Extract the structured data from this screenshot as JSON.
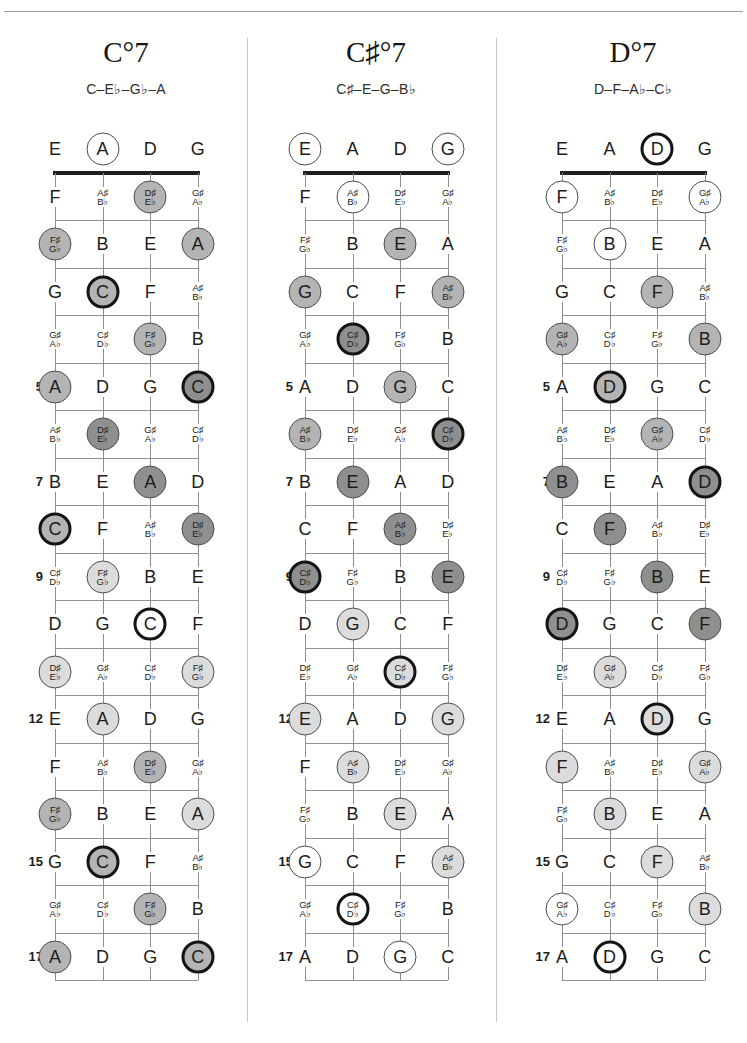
{
  "running_head": "SEVENTH CHORDS",
  "marker_styles": {
    "fills": {
      "w": "#ffffff",
      "l": "#dcdcdc",
      "m": "#b4b4b4",
      "d": "#8f8f8f"
    },
    "ring_thin": "#4d4d4d",
    "ring_root": "#141414"
  },
  "columns": [
    {
      "title": "C°7",
      "subtitle": "C–E♭–G♭–A",
      "rows": [
        {
          "fret": "",
          "cells": [
            [
              "E",
              null
            ],
            [
              "A",
              "w"
            ],
            [
              "D",
              null
            ],
            [
              "G",
              null
            ]
          ]
        },
        {
          "fret": "",
          "cells": [
            [
              "F",
              null
            ],
            [
              "A♯|B♭",
              null
            ],
            [
              "D♯|E♭",
              "m"
            ],
            [
              "G♯|A♭",
              null
            ]
          ]
        },
        {
          "fret": "",
          "cells": [
            [
              "F♯|G♭",
              "m"
            ],
            [
              "B",
              null
            ],
            [
              "E",
              null
            ],
            [
              "A",
              "m"
            ]
          ]
        },
        {
          "fret": "",
          "cells": [
            [
              "G",
              null
            ],
            [
              "C",
              "mR"
            ],
            [
              "F",
              null
            ],
            [
              "A♯|B♭",
              null
            ]
          ]
        },
        {
          "fret": "",
          "cells": [
            [
              "G♯|A♭",
              null
            ],
            [
              "C♯|D♭",
              null
            ],
            [
              "F♯|G♭",
              "m"
            ],
            [
              "B",
              null
            ]
          ]
        },
        {
          "fret": "5",
          "cells": [
            [
              "A",
              "m"
            ],
            [
              "D",
              null
            ],
            [
              "G",
              null
            ],
            [
              "C",
              "dR"
            ]
          ]
        },
        {
          "fret": "",
          "cells": [
            [
              "A♯|B♭",
              null
            ],
            [
              "D♯|E♭",
              "d"
            ],
            [
              "G♯|A♭",
              null
            ],
            [
              "C♯|D♭",
              null
            ]
          ]
        },
        {
          "fret": "7",
          "cells": [
            [
              "B",
              null
            ],
            [
              "E",
              null
            ],
            [
              "A",
              "d"
            ],
            [
              "D",
              null
            ]
          ]
        },
        {
          "fret": "",
          "cells": [
            [
              "C",
              "mR"
            ],
            [
              "F",
              null
            ],
            [
              "A♯|B♭",
              null
            ],
            [
              "D♯|E♭",
              "d"
            ]
          ]
        },
        {
          "fret": "9",
          "cells": [
            [
              "C♯|D♭",
              null
            ],
            [
              "F♯|G♭",
              "l"
            ],
            [
              "B",
              null
            ],
            [
              "E",
              null
            ]
          ]
        },
        {
          "fret": "",
          "cells": [
            [
              "D",
              null
            ],
            [
              "G",
              null
            ],
            [
              "C",
              "wR"
            ],
            [
              "F",
              null
            ]
          ]
        },
        {
          "fret": "",
          "cells": [
            [
              "D♯|E♭",
              "l"
            ],
            [
              "G♯|A♭",
              null
            ],
            [
              "C♯|D♭",
              null
            ],
            [
              "F♯|G♭",
              "l"
            ]
          ]
        },
        {
          "fret": "12",
          "cells": [
            [
              "E",
              null
            ],
            [
              "A",
              "l"
            ],
            [
              "D",
              null
            ],
            [
              "G",
              null
            ]
          ]
        },
        {
          "fret": "",
          "cells": [
            [
              "F",
              null
            ],
            [
              "A♯|B♭",
              null
            ],
            [
              "D♯|E♭",
              "m"
            ],
            [
              "G♯|A♭",
              null
            ]
          ]
        },
        {
          "fret": "",
          "cells": [
            [
              "F♯|G♭",
              "m"
            ],
            [
              "B",
              null
            ],
            [
              "E",
              null
            ],
            [
              "A",
              "l"
            ]
          ]
        },
        {
          "fret": "15",
          "cells": [
            [
              "G",
              null
            ],
            [
              "C",
              "mR"
            ],
            [
              "F",
              null
            ],
            [
              "A♯|B♭",
              null
            ]
          ]
        },
        {
          "fret": "",
          "cells": [
            [
              "G♯|A♭",
              null
            ],
            [
              "C♯|D♭",
              null
            ],
            [
              "F♯|G♭",
              "m"
            ],
            [
              "B",
              null
            ]
          ]
        },
        {
          "fret": "17",
          "cells": [
            [
              "A",
              "m"
            ],
            [
              "D",
              null
            ],
            [
              "G",
              null
            ],
            [
              "C",
              "mR"
            ]
          ]
        }
      ]
    },
    {
      "title": "C♯°7",
      "subtitle": "C♯–E–G–B♭",
      "rows": [
        {
          "fret": "",
          "cells": [
            [
              "E",
              "w"
            ],
            [
              "A",
              null
            ],
            [
              "D",
              null
            ],
            [
              "G",
              "w"
            ]
          ]
        },
        {
          "fret": "",
          "cells": [
            [
              "F",
              null
            ],
            [
              "A♯|B♭",
              "w"
            ],
            [
              "D♯|E♭",
              null
            ],
            [
              "G♯|A♭",
              null
            ]
          ]
        },
        {
          "fret": "",
          "cells": [
            [
              "F♯|G♭",
              null
            ],
            [
              "B",
              null
            ],
            [
              "E",
              "m"
            ],
            [
              "A",
              null
            ]
          ]
        },
        {
          "fret": "",
          "cells": [
            [
              "G",
              "m"
            ],
            [
              "C",
              null
            ],
            [
              "F",
              null
            ],
            [
              "A♯|B♭",
              "m"
            ]
          ]
        },
        {
          "fret": "",
          "cells": [
            [
              "G♯|A♭",
              null
            ],
            [
              "C♯|D♭",
              "dR"
            ],
            [
              "F♯|G♭",
              null
            ],
            [
              "B",
              null
            ]
          ]
        },
        {
          "fret": "5",
          "cells": [
            [
              "A",
              null
            ],
            [
              "D",
              null
            ],
            [
              "G",
              "m"
            ],
            [
              "C",
              null
            ]
          ]
        },
        {
          "fret": "",
          "cells": [
            [
              "A♯|B♭",
              "m"
            ],
            [
              "D♯|E♭",
              null
            ],
            [
              "G♯|A♭",
              null
            ],
            [
              "C♯|D♭",
              "dR"
            ]
          ]
        },
        {
          "fret": "7",
          "cells": [
            [
              "B",
              null
            ],
            [
              "E",
              "d"
            ],
            [
              "A",
              null
            ],
            [
              "D",
              null
            ]
          ]
        },
        {
          "fret": "",
          "cells": [
            [
              "C",
              null
            ],
            [
              "F",
              null
            ],
            [
              "A♯|B♭",
              "d"
            ],
            [
              "D♯|E♭",
              null
            ]
          ]
        },
        {
          "fret": "9",
          "cells": [
            [
              "C♯|D♭",
              "dR"
            ],
            [
              "F♯|G♭",
              null
            ],
            [
              "B",
              null
            ],
            [
              "E",
              "d"
            ]
          ]
        },
        {
          "fret": "",
          "cells": [
            [
              "D",
              null
            ],
            [
              "G",
              "l"
            ],
            [
              "C",
              null
            ],
            [
              "F",
              null
            ]
          ]
        },
        {
          "fret": "",
          "cells": [
            [
              "D♯|E♭",
              null
            ],
            [
              "G♯|A♭",
              null
            ],
            [
              "C♯|D♭",
              "lR"
            ],
            [
              "F♯|G♭",
              null
            ]
          ]
        },
        {
          "fret": "12",
          "cells": [
            [
              "E",
              "l"
            ],
            [
              "A",
              null
            ],
            [
              "D",
              null
            ],
            [
              "G",
              "l"
            ]
          ]
        },
        {
          "fret": "",
          "cells": [
            [
              "F",
              null
            ],
            [
              "A♯|B♭",
              "l"
            ],
            [
              "D♯|E♭",
              null
            ],
            [
              "G♯|A♭",
              null
            ]
          ]
        },
        {
          "fret": "",
          "cells": [
            [
              "F♯|G♭",
              null
            ],
            [
              "B",
              null
            ],
            [
              "E",
              "l"
            ],
            [
              "A",
              null
            ]
          ]
        },
        {
          "fret": "15",
          "cells": [
            [
              "G",
              "w"
            ],
            [
              "C",
              null
            ],
            [
              "F",
              null
            ],
            [
              "A♯|B♭",
              "l"
            ]
          ]
        },
        {
          "fret": "",
          "cells": [
            [
              "G♯|A♭",
              null
            ],
            [
              "C♯|D♭",
              "wR"
            ],
            [
              "F♯|G♭",
              null
            ],
            [
              "B",
              null
            ]
          ]
        },
        {
          "fret": "17",
          "cells": [
            [
              "A",
              null
            ],
            [
              "D",
              null
            ],
            [
              "G",
              "w"
            ],
            [
              "C",
              null
            ]
          ]
        }
      ]
    },
    {
      "title": "D°7",
      "subtitle": "D–F–A♭–C♭",
      "rows": [
        {
          "fret": "",
          "cells": [
            [
              "E",
              null
            ],
            [
              "A",
              null
            ],
            [
              "D",
              "wR"
            ],
            [
              "G",
              null
            ]
          ]
        },
        {
          "fret": "",
          "cells": [
            [
              "F",
              "w"
            ],
            [
              "A♯|B♭",
              null
            ],
            [
              "D♯|E♭",
              null
            ],
            [
              "G♯|A♭",
              "w"
            ]
          ]
        },
        {
          "fret": "",
          "cells": [
            [
              "F♯|G♭",
              null
            ],
            [
              "B",
              "w"
            ],
            [
              "E",
              null
            ],
            [
              "A",
              null
            ]
          ]
        },
        {
          "fret": "",
          "cells": [
            [
              "G",
              null
            ],
            [
              "C",
              null
            ],
            [
              "F",
              "m"
            ],
            [
              "A♯|B♭",
              null
            ]
          ]
        },
        {
          "fret": "",
          "cells": [
            [
              "G♯|A♭",
              "m"
            ],
            [
              "C♯|D♭",
              null
            ],
            [
              "F♯|G♭",
              null
            ],
            [
              "B",
              "m"
            ]
          ]
        },
        {
          "fret": "5",
          "cells": [
            [
              "A",
              null
            ],
            [
              "D",
              "mR"
            ],
            [
              "G",
              null
            ],
            [
              "C",
              null
            ]
          ]
        },
        {
          "fret": "",
          "cells": [
            [
              "A♯|B♭",
              null
            ],
            [
              "D♯|E♭",
              null
            ],
            [
              "G♯|A♭",
              "m"
            ],
            [
              "C♯|D♭",
              null
            ]
          ]
        },
        {
          "fret": "7",
          "cells": [
            [
              "B",
              "d"
            ],
            [
              "E",
              null
            ],
            [
              "A",
              null
            ],
            [
              "D",
              "dR"
            ]
          ]
        },
        {
          "fret": "",
          "cells": [
            [
              "C",
              null
            ],
            [
              "F",
              "d"
            ],
            [
              "A♯|B♭",
              null
            ],
            [
              "D♯|E♭",
              null
            ]
          ]
        },
        {
          "fret": "9",
          "cells": [
            [
              "C♯|D♭",
              null
            ],
            [
              "F♯|G♭",
              null
            ],
            [
              "B",
              "d"
            ],
            [
              "E",
              null
            ]
          ]
        },
        {
          "fret": "",
          "cells": [
            [
              "D",
              "dR"
            ],
            [
              "G",
              null
            ],
            [
              "C",
              null
            ],
            [
              "F",
              "d"
            ]
          ]
        },
        {
          "fret": "",
          "cells": [
            [
              "D♯|E♭",
              null
            ],
            [
              "G♯|A♭",
              "l"
            ],
            [
              "C♯|D♭",
              null
            ],
            [
              "F♯|G♭",
              null
            ]
          ]
        },
        {
          "fret": "12",
          "cells": [
            [
              "E",
              null
            ],
            [
              "A",
              null
            ],
            [
              "D",
              "lR"
            ],
            [
              "G",
              null
            ]
          ]
        },
        {
          "fret": "",
          "cells": [
            [
              "F",
              "l"
            ],
            [
              "A♯|B♭",
              null
            ],
            [
              "D♯|E♭",
              null
            ],
            [
              "G♯|A♭",
              "l"
            ]
          ]
        },
        {
          "fret": "",
          "cells": [
            [
              "F♯|G♭",
              null
            ],
            [
              "B",
              "l"
            ],
            [
              "E",
              null
            ],
            [
              "A",
              null
            ]
          ]
        },
        {
          "fret": "15",
          "cells": [
            [
              "G",
              null
            ],
            [
              "C",
              null
            ],
            [
              "F",
              "l"
            ],
            [
              "A♯|B♭",
              null
            ]
          ]
        },
        {
          "fret": "",
          "cells": [
            [
              "G♯|A♭",
              "w"
            ],
            [
              "C♯|D♭",
              null
            ],
            [
              "F♯|G♭",
              null
            ],
            [
              "B",
              "l"
            ]
          ]
        },
        {
          "fret": "17",
          "cells": [
            [
              "A",
              null
            ],
            [
              "D",
              "wR"
            ],
            [
              "G",
              null
            ],
            [
              "C",
              null
            ]
          ]
        }
      ]
    }
  ]
}
